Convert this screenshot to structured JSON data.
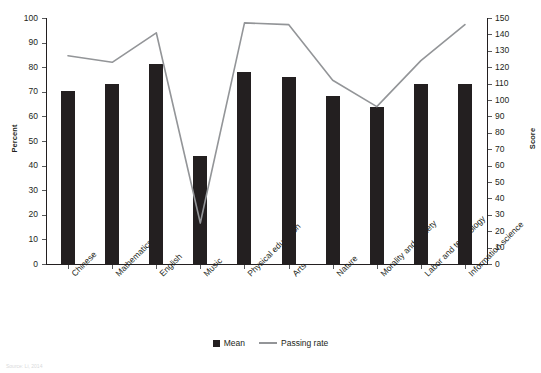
{
  "chart_data": {
    "type": "bar",
    "title": "",
    "categories": [
      "Chinese",
      "Mathematics",
      "English",
      "Music",
      "Physical education",
      "Arts",
      "Nature",
      "Morality and society",
      "Labor and technology",
      "Information science"
    ],
    "series": [
      {
        "name": "Mean",
        "type": "bar",
        "axis": "left",
        "color": "#231f20",
        "values": [
          70.5,
          73,
          81.5,
          44,
          78,
          76,
          68.5,
          64,
          73,
          73
        ]
      },
      {
        "name": "Passing rate",
        "type": "line",
        "axis": "right",
        "color": "#939598",
        "values": [
          127,
          123,
          141,
          25,
          147,
          146,
          112,
          96,
          124,
          146
        ]
      }
    ],
    "xlabel": "",
    "ylabel": "Percent",
    "y2label": "Score",
    "ylim": [
      0,
      100
    ],
    "y2lim": [
      0,
      150
    ],
    "yticks": [
      0,
      10,
      20,
      30,
      40,
      50,
      60,
      70,
      80,
      90,
      100
    ],
    "y2ticks": [
      0,
      10,
      20,
      30,
      40,
      50,
      60,
      70,
      80,
      90,
      100,
      110,
      120,
      130,
      140,
      150
    ],
    "grid": false,
    "legend_position": "bottom",
    "legend": [
      "Mean",
      "Passing rate"
    ]
  },
  "axes": {
    "left_title": "Percent",
    "right_title": "Score"
  },
  "legend": {
    "mean_label": "Mean",
    "passing_rate_label": "Passing rate"
  },
  "footer": {
    "source": "Source: Li, 2014"
  }
}
